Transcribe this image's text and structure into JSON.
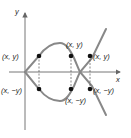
{
  "diagram": {
    "axes": {
      "x_label": "x",
      "y_label": "y"
    },
    "point_labels": {
      "top_left": "(x, y)",
      "top_middle": "(x, y)",
      "top_right": "(x, y)",
      "bottom_left": "(x, −y)",
      "bottom_middle": "(x, −y)",
      "bottom_right": "(x, −y)"
    },
    "colors": {
      "curve": "#888888",
      "axis": "#666666",
      "point": "#111111",
      "text": "#222222"
    }
  }
}
